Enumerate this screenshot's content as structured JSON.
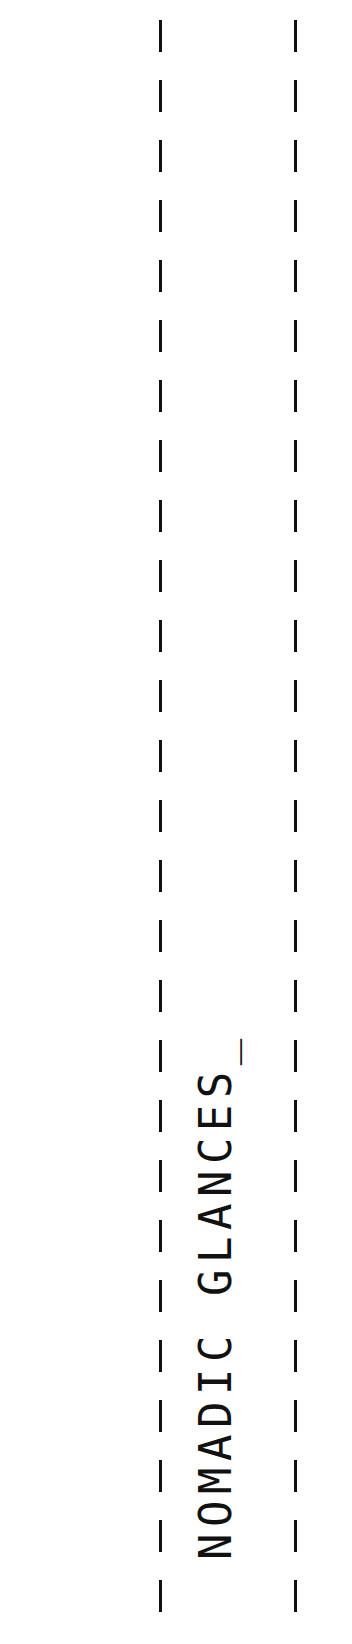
{
  "title": {
    "text": "NOMADIC GLANCES_",
    "color": "#111111"
  },
  "decor": {
    "line_color": "#111111",
    "style": "dashed-vertical-lines"
  }
}
